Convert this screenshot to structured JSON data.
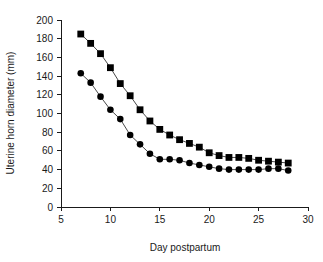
{
  "chart_data": {
    "type": "line",
    "title": "",
    "xlabel": "Day postpartum",
    "ylabel": "Uterine horn diameter (mm)",
    "xlim": [
      5,
      30
    ],
    "ylim": [
      0,
      200
    ],
    "xticks": [
      5,
      10,
      15,
      20,
      25,
      30
    ],
    "yticks": [
      0,
      20,
      40,
      60,
      80,
      100,
      120,
      140,
      160,
      180,
      200
    ],
    "xtick_labels": [
      "5",
      "10",
      "15",
      "20",
      "25",
      "30"
    ],
    "ytick_labels": [
      "0",
      "20",
      "40",
      "60",
      "80",
      "100",
      "120",
      "140",
      "160",
      "180",
      "200"
    ],
    "grid": false,
    "legend": "none",
    "x": [
      7,
      8,
      9,
      10,
      11,
      12,
      13,
      14,
      15,
      16,
      17,
      18,
      19,
      20,
      21,
      22,
      23,
      24,
      25,
      26,
      27,
      28
    ],
    "series": [
      {
        "name": "square-series",
        "marker": "square",
        "color": "#000000",
        "values": [
          185,
          175,
          164,
          149,
          132,
          119,
          104,
          92,
          83,
          77,
          72,
          68,
          64,
          58,
          55,
          53,
          53,
          52,
          50,
          49,
          48,
          47
        ]
      },
      {
        "name": "circle-series",
        "marker": "circle",
        "color": "#000000",
        "values": [
          143,
          133,
          118,
          104,
          94,
          77,
          67,
          57,
          51,
          51,
          50,
          47,
          45,
          43,
          41,
          40,
          40,
          40,
          40,
          41,
          41,
          39
        ]
      }
    ]
  },
  "axis": {
    "x_title": "Day postpartum",
    "y_title": "Uterine horn diameter (mm)"
  }
}
